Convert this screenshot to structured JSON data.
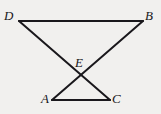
{
  "figure": {
    "kind": "geometry-diagram",
    "background_color": "#f1f0ee",
    "stroke_color": "#1a181c",
    "stroke_width": 2,
    "label_color": "#17161a",
    "points": [
      {
        "name": "D",
        "label": "D",
        "x": 19,
        "y": 21
      },
      {
        "name": "B",
        "label": "B",
        "x": 143,
        "y": 21
      },
      {
        "name": "E",
        "label": "E",
        "x": 85,
        "y": 78
      },
      {
        "name": "A",
        "label": "A",
        "x": 52,
        "y": 100
      },
      {
        "name": "C",
        "label": "C",
        "x": 110,
        "y": 100
      }
    ],
    "segments": [
      {
        "name": "segment-DB",
        "from": "D",
        "to": "B",
        "x1": 19,
        "y1": 21,
        "x2": 143,
        "y2": 21
      },
      {
        "name": "segment-DC",
        "from": "D",
        "to": "C",
        "x1": 19,
        "y1": 21,
        "x2": 110,
        "y2": 100
      },
      {
        "name": "segment-BA",
        "from": "B",
        "to": "A",
        "x1": 143,
        "y1": 21,
        "x2": 52,
        "y2": 100
      },
      {
        "name": "segment-AC",
        "from": "A",
        "to": "C",
        "x1": 52,
        "y1": 100,
        "x2": 110,
        "y2": 100
      }
    ],
    "labels": {
      "D": "D",
      "B": "B",
      "E": "E",
      "A": "A",
      "C": "C"
    }
  }
}
